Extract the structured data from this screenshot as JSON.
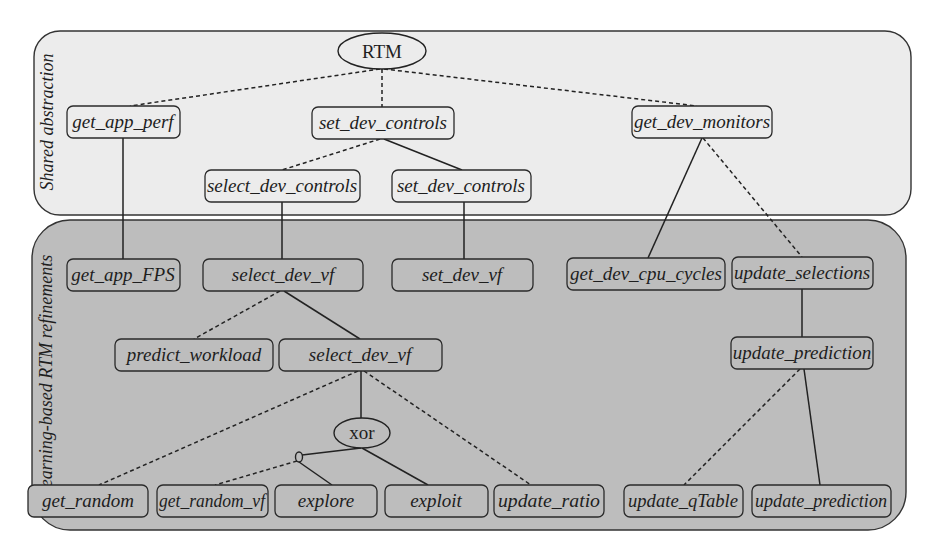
{
  "panels": {
    "top": {
      "label": "Shared abstraction",
      "fill": "#ececec"
    },
    "bottom": {
      "label": "Learning-based RTM refinements",
      "fill": "#bdbdbd"
    }
  },
  "operators": {
    "root": "RTM",
    "xor": "xor"
  },
  "nodes": {
    "get_app_perf": "get_app_perf",
    "set_dev_controls": "set_dev_controls",
    "get_dev_monitors": "get_dev_monitors",
    "select_dev_controls": "select_dev_controls",
    "set_dev_controls_2": "set_dev_controls",
    "get_app_FPS": "get_app_FPS",
    "select_dev_vf": "select_dev_vf",
    "set_dev_vf": "set_dev_vf",
    "get_dev_cpu_cycles": "get_dev_cpu_cycles",
    "update_selections": "update_selections",
    "predict_workload": "predict_workload",
    "select_dev_vf_2": "select_dev_vf",
    "update_prediction": "update_prediction",
    "get_random": "get_random",
    "get_random_vf": "get_random_vf",
    "explore": "explore",
    "exploit": "exploit",
    "update_ratio": "update_ratio",
    "update_qTable": "update_qTable",
    "update_prediction_2": "update_prediction"
  },
  "edges": [
    {
      "from": "RTM",
      "to": "get_app_perf",
      "style": "dashed"
    },
    {
      "from": "RTM",
      "to": "set_dev_controls",
      "style": "dashed"
    },
    {
      "from": "RTM",
      "to": "get_dev_monitors",
      "style": "dashed"
    },
    {
      "from": "set_dev_controls",
      "to": "select_dev_controls",
      "style": "dashed"
    },
    {
      "from": "set_dev_controls",
      "to": "set_dev_controls_2",
      "style": "solid"
    },
    {
      "from": "get_app_perf",
      "to": "get_app_FPS",
      "style": "solid"
    },
    {
      "from": "select_dev_controls",
      "to": "select_dev_vf",
      "style": "solid"
    },
    {
      "from": "set_dev_controls_2",
      "to": "set_dev_vf",
      "style": "solid"
    },
    {
      "from": "get_dev_monitors",
      "to": "get_dev_cpu_cycles",
      "style": "solid"
    },
    {
      "from": "get_dev_monitors",
      "to": "update_selections",
      "style": "dashed"
    },
    {
      "from": "select_dev_vf",
      "to": "predict_workload",
      "style": "dashed"
    },
    {
      "from": "select_dev_vf",
      "to": "select_dev_vf_2",
      "style": "solid"
    },
    {
      "from": "update_selections",
      "to": "update_prediction",
      "style": "solid"
    },
    {
      "from": "select_dev_vf_2",
      "to": "get_random",
      "style": "dashed"
    },
    {
      "from": "select_dev_vf_2",
      "to": "xor",
      "style": "solid"
    },
    {
      "from": "select_dev_vf_2",
      "to": "update_ratio",
      "style": "dashed"
    },
    {
      "from": "xor",
      "to": "small-operator",
      "style": "solid"
    },
    {
      "from": "xor",
      "to": "exploit",
      "style": "solid"
    },
    {
      "from": "small-operator",
      "to": "get_random_vf",
      "style": "dashed"
    },
    {
      "from": "small-operator",
      "to": "explore",
      "style": "solid"
    },
    {
      "from": "update_prediction",
      "to": "update_qTable",
      "style": "dashed"
    },
    {
      "from": "update_prediction",
      "to": "update_prediction_2",
      "style": "solid"
    }
  ]
}
